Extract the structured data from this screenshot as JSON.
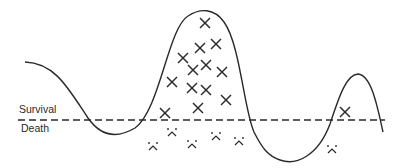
{
  "diagram": {
    "type": "survival-landscape",
    "threshold_line": {
      "y": 120,
      "x_start": 18,
      "x_end": 385,
      "style": "dashed",
      "color": "#2a2a2a"
    },
    "labels": {
      "survival": "Survival",
      "death": "Death"
    },
    "curve": {
      "color": "#2a2a2a",
      "path": "M25,62 C55,63 68,88 88,118 C102,138 118,138 135,128 C160,110 168,28 188,16 C200,8 214,8 224,22 C240,44 244,110 254,132 C262,148 268,156 280,160 C296,166 318,156 330,124 C338,100 346,74 358,74 C372,75 378,110 383,132"
    },
    "survivors": {
      "symbol": "x-mark",
      "points": [
        [
          205,
          23
        ],
        [
          200,
          48
        ],
        [
          216,
          44
        ],
        [
          183,
          58
        ],
        [
          193,
          70
        ],
        [
          206,
          65
        ],
        [
          222,
          72
        ],
        [
          172,
          82
        ],
        [
          192,
          88
        ],
        [
          206,
          90
        ],
        [
          226,
          100
        ],
        [
          198,
          108
        ],
        [
          165,
          113
        ],
        [
          345,
          112
        ]
      ]
    },
    "deaths": {
      "symbol": "frown-face",
      "points": [
        [
          172,
          133
        ],
        [
          153,
          147
        ],
        [
          192,
          145
        ],
        [
          216,
          137
        ],
        [
          239,
          142
        ],
        [
          332,
          150
        ]
      ]
    }
  }
}
